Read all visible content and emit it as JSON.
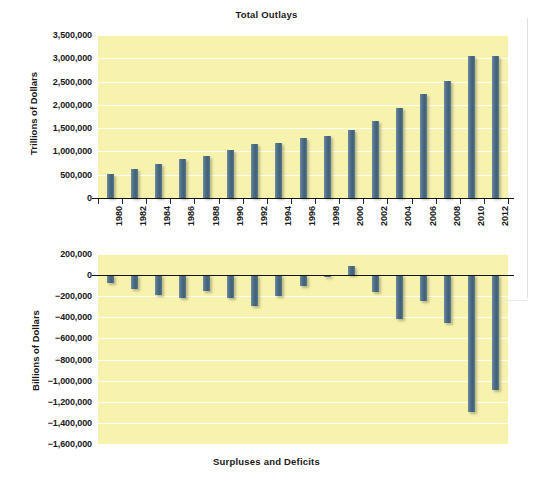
{
  "figure": {
    "top_chart_title": "Total Outlays",
    "bottom_chart_caption": "Surpluses and Deficits",
    "colors": {
      "plot_background": "#f7f2ae",
      "bar": "#4f7087",
      "gridline": "#ffffff",
      "axis": "#14140f",
      "text": "#18181a"
    }
  },
  "chart_data": [
    {
      "type": "bar",
      "title": "Total Outlays",
      "xlabel": "",
      "ylabel": "Trillions of Dollars",
      "ylim": [
        0,
        3500000
      ],
      "ytick_labels": [
        "0",
        "500,000",
        "1,000,000",
        "1,500,000",
        "2,000,000",
        "2,500,000",
        "3,000,000",
        "3,500,000"
      ],
      "ytick_values": [
        0,
        500000,
        1000000,
        1500000,
        2000000,
        2500000,
        3000000,
        3500000
      ],
      "grid": true,
      "legend": "none",
      "categories": [
        "1980",
        "1982",
        "1984",
        "1986",
        "1988",
        "1990",
        "1992",
        "1994",
        "1996",
        "1998",
        "2000",
        "2002",
        "2004",
        "2006",
        "2008",
        "2010",
        "2012"
      ],
      "values": [
        517000,
        627000,
        730000,
        836000,
        892000,
        1040000,
        1160000,
        1190000,
        1290000,
        1340000,
        1470000,
        1660000,
        1940000,
        2240000,
        2510000,
        3050000,
        3050000
      ]
    },
    {
      "type": "bar",
      "title": "",
      "caption": "Surpluses and Deficits",
      "xlabel": "",
      "ylabel": "Billions of Dollars",
      "ylim": [
        -1600000,
        200000
      ],
      "ytick_labels": [
        "200,000",
        "0",
        "−200,000",
        "−400,000",
        "−600,000",
        "−800,000",
        "−1,000,000",
        "−1,200,000",
        "−1,400,000",
        "−1,600,000"
      ],
      "ytick_values": [
        200000,
        0,
        -200000,
        -400000,
        -600000,
        -800000,
        -1000000,
        -1200000,
        -1400000,
        -1600000
      ],
      "grid": true,
      "legend": "none",
      "categories": [
        "1980",
        "1982",
        "1984",
        "1986",
        "1988",
        "1990",
        "1992",
        "1994",
        "1996",
        "1998",
        "2000",
        "2002",
        "2004",
        "2006",
        "2008",
        "2010",
        "2012"
      ],
      "values": [
        -74000,
        -128000,
        -185000,
        -221000,
        -155000,
        -221000,
        -290000,
        -203000,
        -107000,
        -22000,
        86000,
        -158000,
        -413000,
        -248000,
        -459000,
        -1294000,
        -1087000
      ]
    }
  ]
}
